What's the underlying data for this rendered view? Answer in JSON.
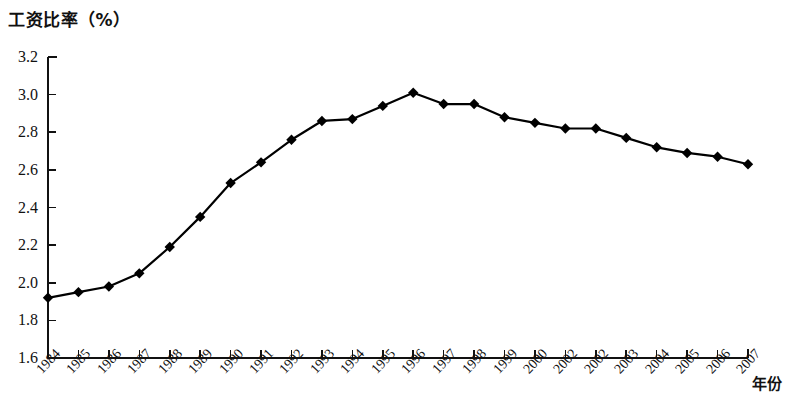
{
  "chart_data": {
    "type": "line",
    "title": "工资比率（%）",
    "ylabel": "工资比率（%）",
    "xlabel": "年份",
    "ylim": [
      1.6,
      3.2
    ],
    "ytick_labels": [
      "3.2",
      "3.0",
      "2.8",
      "2.6",
      "2.4",
      "2.2",
      "2.0",
      "1.8",
      "1.6"
    ],
    "ytick_values": [
      3.2,
      3.0,
      2.8,
      2.6,
      2.4,
      2.2,
      2.0,
      1.8,
      1.6
    ],
    "grid": false,
    "legend": null,
    "marker": "diamond",
    "line_color": "#000000",
    "marker_color": "#000000",
    "categories": [
      "1984",
      "1985",
      "1986",
      "1987",
      "1988",
      "1989",
      "1990",
      "1991",
      "1992",
      "1993",
      "1994",
      "1995",
      "1996",
      "1997",
      "1998",
      "1999",
      "2000",
      "2002",
      "2002",
      "2003",
      "2004",
      "2005",
      "2006",
      "2007"
    ],
    "values": [
      1.92,
      1.95,
      1.98,
      2.05,
      2.19,
      2.35,
      2.53,
      2.64,
      2.76,
      2.86,
      2.87,
      2.94,
      3.01,
      2.95,
      2.95,
      2.88,
      2.85,
      2.82,
      2.82,
      2.77,
      2.72,
      2.69,
      2.67,
      2.63
    ]
  }
}
